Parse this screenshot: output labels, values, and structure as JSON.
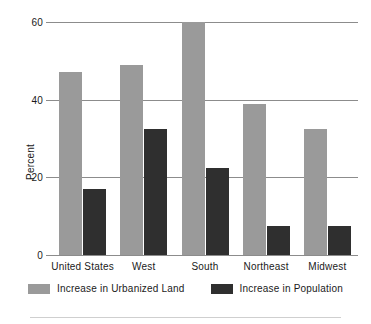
{
  "chart_data": {
    "type": "bar",
    "title": "",
    "xlabel": "",
    "ylabel": "Percent",
    "ylim": [
      0,
      60
    ],
    "yticks": [
      0,
      20,
      40,
      60
    ],
    "ytick_labels": [
      "0",
      "20",
      "40",
      "60"
    ],
    "grid": true,
    "legend_position": "bottom",
    "categories": [
      "United States",
      "West",
      "South",
      "Northeast",
      "Midwest"
    ],
    "series": [
      {
        "name": "Increase in Urbanized Land",
        "color": "#9a9a9a",
        "values": [
          47,
          49,
          60,
          39,
          32.5
        ]
      },
      {
        "name": "Increase in Population",
        "color": "#2f2f2f",
        "values": [
          17,
          32.5,
          22.5,
          7.5,
          7.5
        ]
      }
    ]
  }
}
